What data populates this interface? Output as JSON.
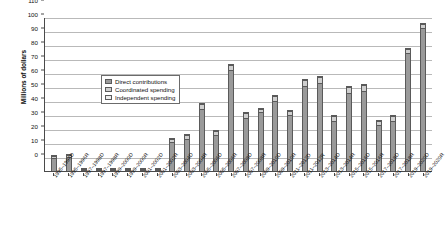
{
  "chart_data": {
    "type": "bar",
    "title": "",
    "subtitle": "",
    "xlabel": "",
    "ylabel": "Millions of dollars",
    "ylim": [
      0,
      110
    ],
    "ytick_step": 10,
    "yticks": [
      0,
      10,
      20,
      30,
      40,
      50,
      60,
      70,
      80,
      90,
      100,
      110
    ],
    "grid": true,
    "stacked": true,
    "legend_position": "upper-left-inside",
    "categories": [
      "1995–1996D",
      "1995–1996R",
      "1997–1998D",
      "1997–1998R",
      "1999–2000D",
      "1999–2000R",
      "2001–2002D",
      "2001–2002R",
      "2003–2004D",
      "2003–2004R",
      "2005–2006D",
      "2005–2006R",
      "2007–2008D",
      "2007–2008R",
      "2009–2010D",
      "2009–2010R",
      "2011–2012D",
      "2011–2012R",
      "2013–2014D",
      "2013–2014R",
      "2015–2016D",
      "2015–2016R",
      "2017–2018D",
      "2017–2018R",
      "2019–2020D",
      "2019–2020R"
    ],
    "series": [
      {
        "name": "Direct contributions",
        "color": "#9a9a9a",
        "values": [
          9.0,
          10.0,
          0.8,
          0.8,
          0.7,
          0.7,
          0.8,
          0.8,
          21.0,
          23.0,
          44.0,
          26.0,
          72.0,
          38.0,
          42.0,
          50.0,
          40.0,
          61.0,
          63.0,
          36.0,
          56.0,
          57.0,
          33.0,
          36.0,
          84.0,
          102.0
        ]
      },
      {
        "name": "Coordinated spending",
        "color": "#cfcfcf",
        "values": [
          1.5,
          1.5,
          0.4,
          0.4,
          0.4,
          0.4,
          0.4,
          0.4,
          2.0,
          2.5,
          4.0,
          2.5,
          4.0,
          3.5,
          2.5,
          3.5,
          3.0,
          4.0,
          4.0,
          3.0,
          4.0,
          4.5,
          3.0,
          3.0,
          3.0,
          3.0
        ]
      },
      {
        "name": "Independent spending",
        "color": "#ededed",
        "values": [
          0.3,
          0.3,
          0.2,
          0.2,
          0.2,
          0.2,
          0.2,
          0.2,
          0.5,
          0.5,
          0.8,
          0.5,
          0.8,
          0.5,
          0.5,
          0.5,
          0.5,
          0.8,
          0.8,
          0.5,
          0.8,
          0.8,
          0.5,
          0.5,
          0.8,
          0.8
        ]
      }
    ]
  },
  "legend": {
    "items": [
      {
        "label": "Direct contributions",
        "key": "direct"
      },
      {
        "label": "Coordinated spending",
        "key": "coord"
      },
      {
        "label": "Independent spending",
        "key": "indep"
      }
    ]
  }
}
